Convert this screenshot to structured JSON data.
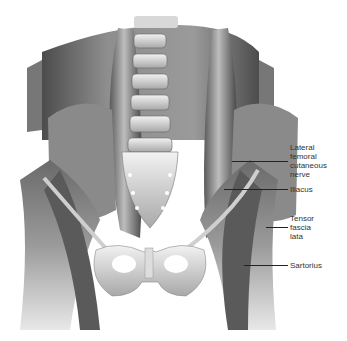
{
  "figure": {
    "labels": [
      {
        "id": "lateral-femoral-cutaneous-nerve",
        "text": "Lateral\nfemoral\ncutaneous\nnerve",
        "top": 143,
        "leader_y": 161,
        "leader_x1": 232,
        "leader_x2": 288
      },
      {
        "id": "iliacus",
        "text": "Iliacus",
        "top": 185,
        "leader_y": 189,
        "leader_x1": 224,
        "leader_x2": 288
      },
      {
        "id": "tensor-fascia-lata",
        "text": "Tensor\nfascia\nlata",
        "top": 214,
        "leader_y": 227,
        "leader_x1": 266,
        "leader_x2": 288
      },
      {
        "id": "sartorius",
        "text": "Sartorius",
        "top": 261,
        "leader_y": 265,
        "leader_x1": 244,
        "leader_x2": 288
      }
    ]
  }
}
